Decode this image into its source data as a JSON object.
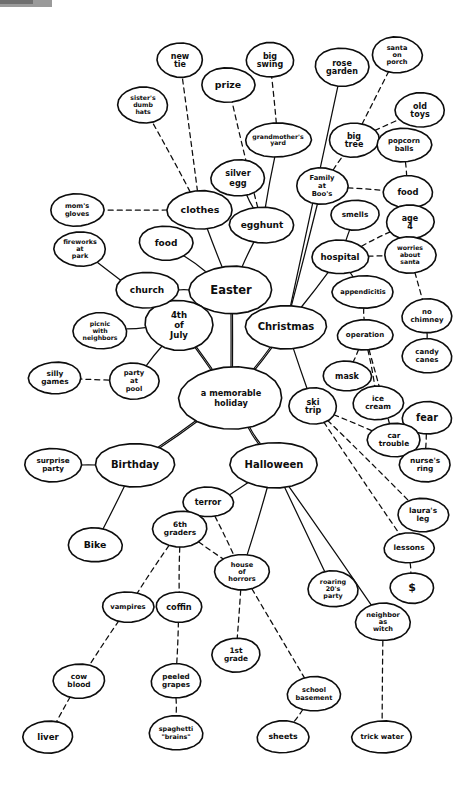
{
  "diagram": {
    "type": "mind-map",
    "ink_color": "#0d0d0d",
    "background_color": "#ffffff",
    "corner_marker_color": "#9a9a9a",
    "nodes": [
      {
        "id": "center",
        "label": "a memorable\nholiday",
        "x": 231,
        "y": 398,
        "rx": 52,
        "ry": 31,
        "size": 8.2,
        "level": "root"
      },
      {
        "id": "easter",
        "label": "Easter",
        "x": 231,
        "y": 290,
        "rx": 41,
        "ry": 24,
        "size": 11.5,
        "level": "main"
      },
      {
        "id": "christmas",
        "label": "Christmas",
        "x": 286,
        "y": 327,
        "rx": 40,
        "ry": 22,
        "size": 10,
        "level": "main"
      },
      {
        "id": "fourth",
        "label": "4th\nof\nJuly",
        "x": 179,
        "y": 325,
        "rx": 34,
        "ry": 25,
        "size": 8.6,
        "level": "main"
      },
      {
        "id": "birthday",
        "label": "Birthday",
        "x": 135,
        "y": 465,
        "rx": 39,
        "ry": 22,
        "size": 10,
        "level": "main"
      },
      {
        "id": "halloween",
        "label": "Halloween",
        "x": 274,
        "y": 465,
        "rx": 43,
        "ry": 23,
        "size": 10,
        "level": "main"
      },
      {
        "id": "clothes",
        "label": "clothes",
        "x": 200,
        "y": 210,
        "rx": 33,
        "ry": 19,
        "size": 9.5,
        "level": "sub"
      },
      {
        "id": "moms_gloves",
        "label": "mom's\ngloves",
        "x": 77,
        "y": 210,
        "rx": 27,
        "ry": 16,
        "size": 6.6,
        "level": "leaf"
      },
      {
        "id": "food_easter",
        "label": "food",
        "x": 166,
        "y": 243,
        "rx": 27,
        "ry": 17,
        "size": 9,
        "level": "sub"
      },
      {
        "id": "church",
        "label": "church",
        "x": 147,
        "y": 290,
        "rx": 31,
        "ry": 18,
        "size": 9,
        "level": "sub"
      },
      {
        "id": "egghunt",
        "label": "egghunt",
        "x": 262,
        "y": 225,
        "rx": 32,
        "ry": 18,
        "size": 9,
        "level": "sub"
      },
      {
        "id": "silver_egg",
        "label": "silver\negg",
        "x": 238,
        "y": 178,
        "rx": 27,
        "ry": 18,
        "size": 8.2,
        "level": "leaf"
      },
      {
        "id": "grandmothers_yard",
        "label": "grandmother's\nyard",
        "x": 278,
        "y": 140,
        "rx": 33,
        "ry": 17,
        "size": 6.2,
        "level": "leaf"
      },
      {
        "id": "big_swing",
        "label": "big\nswing",
        "x": 270,
        "y": 60,
        "rx": 24,
        "ry": 17,
        "size": 8,
        "level": "leaf"
      },
      {
        "id": "prize",
        "label": "prize",
        "x": 228,
        "y": 85,
        "rx": 27,
        "ry": 17,
        "size": 9.4,
        "level": "leaf"
      },
      {
        "id": "new_tie",
        "label": "new\ntie",
        "x": 180,
        "y": 60,
        "rx": 23,
        "ry": 17,
        "size": 8,
        "level": "leaf"
      },
      {
        "id": "sisters_hats",
        "label": "sister's\ndumb\nhats",
        "x": 143,
        "y": 105,
        "rx": 25,
        "ry": 18,
        "size": 6.2,
        "level": "leaf"
      },
      {
        "id": "fireworks_park",
        "label": "fireworks\nat\npark",
        "x": 80,
        "y": 249,
        "rx": 26,
        "ry": 17,
        "size": 6.4,
        "level": "leaf"
      },
      {
        "id": "picnic",
        "label": "picnic\nwith\nneighbors",
        "x": 100,
        "y": 331,
        "rx": 27,
        "ry": 18,
        "size": 6.2,
        "level": "leaf"
      },
      {
        "id": "party_pool",
        "label": "party\nat\npool",
        "x": 134,
        "y": 381,
        "rx": 25,
        "ry": 18,
        "size": 6.8,
        "level": "leaf"
      },
      {
        "id": "silly_games",
        "label": "silly\ngames",
        "x": 55,
        "y": 378,
        "rx": 26,
        "ry": 16,
        "size": 7.4,
        "level": "leaf"
      },
      {
        "id": "rose_garden",
        "label": "rose\ngarden",
        "x": 342,
        "y": 67,
        "rx": 27,
        "ry": 19,
        "size": 8,
        "level": "leaf"
      },
      {
        "id": "santa_porch",
        "label": "santa\non\nporch",
        "x": 397,
        "y": 55,
        "rx": 25,
        "ry": 18,
        "size": 6.6,
        "level": "leaf"
      },
      {
        "id": "big_tree",
        "label": "big\ntree",
        "x": 354,
        "y": 140,
        "rx": 25,
        "ry": 17,
        "size": 8,
        "level": "leaf"
      },
      {
        "id": "old_toys",
        "label": "old\ntoys",
        "x": 420,
        "y": 110,
        "rx": 25,
        "ry": 17,
        "size": 8,
        "level": "leaf"
      },
      {
        "id": "popcorn_balls",
        "label": "popcorn\nballs",
        "x": 404,
        "y": 145,
        "rx": 27,
        "ry": 17,
        "size": 7,
        "level": "leaf"
      },
      {
        "id": "food_xmas",
        "label": "food",
        "x": 408,
        "y": 192,
        "rx": 25,
        "ry": 16,
        "size": 8.4,
        "level": "leaf"
      },
      {
        "id": "family_boos",
        "label": "Family\nat\nBoo's",
        "x": 322,
        "y": 186,
        "rx": 26,
        "ry": 18,
        "size": 6.8,
        "level": "leaf"
      },
      {
        "id": "smells",
        "label": "smells",
        "x": 355,
        "y": 215,
        "rx": 24,
        "ry": 15,
        "size": 7.4,
        "level": "leaf"
      },
      {
        "id": "age4",
        "label": "age\n4",
        "x": 410,
        "y": 222,
        "rx": 24,
        "ry": 17,
        "size": 8,
        "level": "leaf"
      },
      {
        "id": "hospital",
        "label": "hospital",
        "x": 340,
        "y": 257,
        "rx": 28,
        "ry": 17,
        "size": 8.6,
        "level": "leaf"
      },
      {
        "id": "worries_santa",
        "label": "worries\nabout\nsanta",
        "x": 410,
        "y": 255,
        "rx": 26,
        "ry": 18,
        "size": 6.2,
        "level": "leaf"
      },
      {
        "id": "appendicitis",
        "label": "appendicitis",
        "x": 363,
        "y": 292,
        "rx": 31,
        "ry": 16,
        "size": 6.6,
        "level": "leaf"
      },
      {
        "id": "no_chimney",
        "label": "no\nchimney",
        "x": 427,
        "y": 316,
        "rx": 25,
        "ry": 17,
        "size": 7,
        "level": "leaf"
      },
      {
        "id": "operation",
        "label": "operation",
        "x": 365,
        "y": 335,
        "rx": 28,
        "ry": 15,
        "size": 7,
        "level": "leaf"
      },
      {
        "id": "candy_canes",
        "label": "candy\ncanes",
        "x": 427,
        "y": 356,
        "rx": 25,
        "ry": 17,
        "size": 7,
        "level": "leaf"
      },
      {
        "id": "mask",
        "label": "mask",
        "x": 347,
        "y": 376,
        "rx": 24,
        "ry": 15,
        "size": 8,
        "level": "leaf"
      },
      {
        "id": "ski_trip",
        "label": "ski\ntrip",
        "x": 313,
        "y": 406,
        "rx": 24,
        "ry": 18,
        "size": 8,
        "level": "leaf"
      },
      {
        "id": "ice_cream",
        "label": "ice\ncream",
        "x": 378,
        "y": 403,
        "rx": 25,
        "ry": 17,
        "size": 7.4,
        "level": "leaf"
      },
      {
        "id": "fear",
        "label": "fear",
        "x": 427,
        "y": 418,
        "rx": 25,
        "ry": 16,
        "size": 9.6,
        "level": "leaf"
      },
      {
        "id": "car_trouble",
        "label": "car\ntrouble",
        "x": 394,
        "y": 440,
        "rx": 26,
        "ry": 17,
        "size": 7.4,
        "level": "leaf"
      },
      {
        "id": "nurses_ring",
        "label": "nurse's\nring",
        "x": 425,
        "y": 465,
        "rx": 25,
        "ry": 17,
        "size": 7.4,
        "level": "leaf"
      },
      {
        "id": "lauras_leg",
        "label": "laura's\nleg",
        "x": 423,
        "y": 515,
        "rx": 25,
        "ry": 17,
        "size": 7.4,
        "level": "leaf"
      },
      {
        "id": "lessons",
        "label": "lessons",
        "x": 409,
        "y": 548,
        "rx": 25,
        "ry": 15,
        "size": 7.4,
        "level": "leaf"
      },
      {
        "id": "dollar",
        "label": "$",
        "x": 412,
        "y": 588,
        "rx": 22,
        "ry": 15,
        "size": 11,
        "level": "leaf"
      },
      {
        "id": "surprise_party",
        "label": "surprise\nparty",
        "x": 53,
        "y": 465,
        "rx": 28,
        "ry": 17,
        "size": 7.2,
        "level": "leaf"
      },
      {
        "id": "bike",
        "label": "Bike",
        "x": 95,
        "y": 545,
        "rx": 27,
        "ry": 17,
        "size": 9.4,
        "level": "leaf"
      },
      {
        "id": "terror",
        "label": "terror",
        "x": 208,
        "y": 502,
        "rx": 25,
        "ry": 15,
        "size": 8,
        "level": "leaf"
      },
      {
        "id": "sixth_graders",
        "label": "6th\ngraders",
        "x": 180,
        "y": 529,
        "rx": 27,
        "ry": 18,
        "size": 7.4,
        "level": "leaf"
      },
      {
        "id": "house_horrors",
        "label": "house\nof\nhorrors",
        "x": 242,
        "y": 572,
        "rx": 27,
        "ry": 18,
        "size": 6.6,
        "level": "leaf"
      },
      {
        "id": "roaring20",
        "label": "roaring\n20's\nparty",
        "x": 333,
        "y": 589,
        "rx": 25,
        "ry": 18,
        "size": 6.4,
        "level": "leaf"
      },
      {
        "id": "neighbor_witch",
        "label": "neighbor\nas\nwitch",
        "x": 383,
        "y": 622,
        "rx": 27,
        "ry": 19,
        "size": 6.6,
        "level": "leaf"
      },
      {
        "id": "vampires",
        "label": "vampires",
        "x": 128,
        "y": 607,
        "rx": 26,
        "ry": 15,
        "size": 6.8,
        "level": "leaf"
      },
      {
        "id": "coffin",
        "label": "coffin",
        "x": 179,
        "y": 607,
        "rx": 23,
        "ry": 15,
        "size": 8.2,
        "level": "leaf"
      },
      {
        "id": "first_grade",
        "label": "1st\ngrade",
        "x": 236,
        "y": 655,
        "rx": 24,
        "ry": 17,
        "size": 7.4,
        "level": "leaf"
      },
      {
        "id": "cow_blood",
        "label": "cow\nblood",
        "x": 79,
        "y": 681,
        "rx": 26,
        "ry": 17,
        "size": 7.4,
        "level": "leaf"
      },
      {
        "id": "peeled_grapes",
        "label": "peeled\ngrapes",
        "x": 176,
        "y": 681,
        "rx": 25,
        "ry": 17,
        "size": 7.2,
        "level": "leaf"
      },
      {
        "id": "school_basement",
        "label": "school\nbasement",
        "x": 314,
        "y": 694,
        "rx": 27,
        "ry": 17,
        "size": 6.6,
        "level": "leaf"
      },
      {
        "id": "liver",
        "label": "liver",
        "x": 48,
        "y": 737,
        "rx": 25,
        "ry": 16,
        "size": 8.6,
        "level": "leaf"
      },
      {
        "id": "spaghetti_brains",
        "label": "spaghetti\n\"brains\"",
        "x": 176,
        "y": 733,
        "rx": 27,
        "ry": 17,
        "size": 6.4,
        "level": "leaf"
      },
      {
        "id": "sheets",
        "label": "sheets",
        "x": 283,
        "y": 737,
        "rx": 26,
        "ry": 16,
        "size": 7.8,
        "level": "leaf"
      },
      {
        "id": "trick_water",
        "label": "trick water",
        "x": 382,
        "y": 737,
        "rx": 30,
        "ry": 16,
        "size": 7,
        "level": "leaf"
      }
    ],
    "edges": [
      {
        "from": "center",
        "to": "easter",
        "style": "thick"
      },
      {
        "from": "center",
        "to": "christmas",
        "style": "thick"
      },
      {
        "from": "center",
        "to": "fourth",
        "style": "thick"
      },
      {
        "from": "center",
        "to": "birthday",
        "style": "thick"
      },
      {
        "from": "center",
        "to": "halloween",
        "style": "thick"
      },
      {
        "from": "easter",
        "to": "clothes",
        "style": "solid"
      },
      {
        "from": "easter",
        "to": "food_easter",
        "style": "solid"
      },
      {
        "from": "easter",
        "to": "church",
        "style": "solid"
      },
      {
        "from": "easter",
        "to": "egghunt",
        "style": "solid"
      },
      {
        "from": "clothes",
        "to": "moms_gloves",
        "style": "dashed"
      },
      {
        "from": "clothes",
        "to": "sisters_hats",
        "style": "dashed"
      },
      {
        "from": "clothes",
        "to": "new_tie",
        "style": "dashed"
      },
      {
        "from": "egghunt",
        "to": "silver_egg",
        "style": "solid"
      },
      {
        "from": "egghunt",
        "to": "prize",
        "style": "dashed"
      },
      {
        "from": "egghunt",
        "to": "grandmothers_yard",
        "style": "solid"
      },
      {
        "from": "grandmothers_yard",
        "to": "big_swing",
        "style": "dashed"
      },
      {
        "from": "fourth",
        "to": "fireworks_park",
        "style": "solid"
      },
      {
        "from": "fourth",
        "to": "picnic",
        "style": "solid"
      },
      {
        "from": "fourth",
        "to": "party_pool",
        "style": "solid"
      },
      {
        "from": "party_pool",
        "to": "silly_games",
        "style": "dashed"
      },
      {
        "from": "christmas",
        "to": "rose_garden",
        "style": "solid"
      },
      {
        "from": "christmas",
        "to": "family_boos",
        "style": "solid"
      },
      {
        "from": "christmas",
        "to": "hospital",
        "style": "solid"
      },
      {
        "from": "family_boos",
        "to": "big_tree",
        "style": "dashed"
      },
      {
        "from": "family_boos",
        "to": "food_xmas",
        "style": "dashed"
      },
      {
        "from": "big_tree",
        "to": "santa_porch",
        "style": "dashed"
      },
      {
        "from": "big_tree",
        "to": "old_toys",
        "style": "dashed"
      },
      {
        "from": "popcorn_balls",
        "to": "food_xmas",
        "style": "dashed"
      },
      {
        "from": "hospital",
        "to": "smells",
        "style": "solid"
      },
      {
        "from": "hospital",
        "to": "age4",
        "style": "dashed"
      },
      {
        "from": "hospital",
        "to": "worries_santa",
        "style": "dashed"
      },
      {
        "from": "hospital",
        "to": "appendicitis",
        "style": "dashed"
      },
      {
        "from": "worries_santa",
        "to": "no_chimney",
        "style": "dashed"
      },
      {
        "from": "no_chimney",
        "to": "candy_canes",
        "style": "dashed"
      },
      {
        "from": "appendicitis",
        "to": "operation",
        "style": "dashed"
      },
      {
        "from": "operation",
        "to": "mask",
        "style": "dashed"
      },
      {
        "from": "operation",
        "to": "ice_cream",
        "style": "dashed"
      },
      {
        "from": "operation",
        "to": "car_trouble",
        "style": "dashed"
      },
      {
        "from": "fear",
        "to": "nurses_ring",
        "style": "dashed"
      },
      {
        "from": "ski_trip",
        "to": "car_trouble",
        "style": "dashed"
      },
      {
        "from": "ski_trip",
        "to": "lauras_leg",
        "style": "dashed"
      },
      {
        "from": "ski_trip",
        "to": "lessons",
        "style": "dashed"
      },
      {
        "from": "lessons",
        "to": "dollar",
        "style": "dashed"
      },
      {
        "from": "christmas",
        "to": "ski_trip",
        "style": "solid"
      },
      {
        "from": "birthday",
        "to": "surprise_party",
        "style": "solid"
      },
      {
        "from": "birthday",
        "to": "bike",
        "style": "solid"
      },
      {
        "from": "halloween",
        "to": "sixth_graders",
        "style": "solid"
      },
      {
        "from": "halloween",
        "to": "house_horrors",
        "style": "solid"
      },
      {
        "from": "halloween",
        "to": "roaring20",
        "style": "solid"
      },
      {
        "from": "halloween",
        "to": "neighbor_witch",
        "style": "solid"
      },
      {
        "from": "sixth_graders",
        "to": "terror",
        "style": "dashed"
      },
      {
        "from": "terror",
        "to": "house_horrors",
        "style": "dashed"
      },
      {
        "from": "sixth_graders",
        "to": "vampires",
        "style": "dashed"
      },
      {
        "from": "sixth_graders",
        "to": "coffin",
        "style": "dashed"
      },
      {
        "from": "sixth_graders",
        "to": "house_horrors",
        "style": "dashed"
      },
      {
        "from": "house_horrors",
        "to": "first_grade",
        "style": "dashed"
      },
      {
        "from": "house_horrors",
        "to": "school_basement",
        "style": "dashed"
      },
      {
        "from": "vampires",
        "to": "cow_blood",
        "style": "dashed"
      },
      {
        "from": "cow_blood",
        "to": "liver",
        "style": "dashed"
      },
      {
        "from": "coffin",
        "to": "peeled_grapes",
        "style": "dashed"
      },
      {
        "from": "peeled_grapes",
        "to": "spaghetti_brains",
        "style": "dashed"
      },
      {
        "from": "school_basement",
        "to": "sheets",
        "style": "dashed"
      },
      {
        "from": "neighbor_witch",
        "to": "trick_water",
        "style": "dashed"
      }
    ]
  }
}
